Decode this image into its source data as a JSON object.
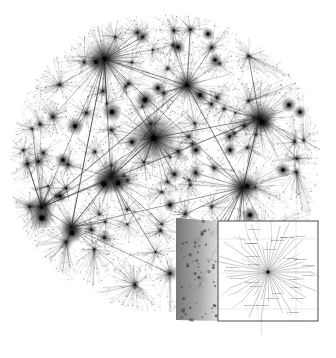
{
  "figure": {
    "caption": "",
    "background_color": "#ffffff",
    "ink_color": "#2b2b2b",
    "inset_border_color": "#4a4a4a",
    "cone_color_near": "#8a8a8a",
    "cone_color_far": "#d8d8d8"
  },
  "chart_data": {
    "type": "scatter",
    "subtitle": "",
    "xlabel": "",
    "ylabel": "",
    "grid": false,
    "legend_position": "none",
    "node_count_approx": 20000,
    "edge_count_approx": 55000,
    "layout": "force-directed radial",
    "hub_nodes": [
      {
        "x": 0.46,
        "y": 0.4,
        "degree": 980,
        "label": "core-hub"
      },
      {
        "x": 0.31,
        "y": 0.16,
        "degree": 640,
        "label": "hub-nw"
      },
      {
        "x": 0.78,
        "y": 0.34,
        "degree": 520,
        "label": "hub-ne"
      },
      {
        "x": 0.33,
        "y": 0.52,
        "degree": 470,
        "label": "hub-w"
      },
      {
        "x": 0.73,
        "y": 0.55,
        "degree": 430,
        "label": "hub-e"
      },
      {
        "x": 0.12,
        "y": 0.61,
        "degree": 300,
        "label": "hub-sw"
      },
      {
        "x": 0.56,
        "y": 0.24,
        "degree": 360,
        "label": "hub-n"
      },
      {
        "x": 0.21,
        "y": 0.67,
        "degree": 260,
        "label": "hub-s"
      }
    ],
    "series": [
      {
        "name": "links",
        "values": []
      }
    ]
  },
  "inset": {
    "name": "magnified-router-detail",
    "center_node": "12.123.45.1",
    "visible": true,
    "box": {
      "x": 218,
      "y": 221,
      "w": 100,
      "h": 100
    },
    "labels": [
      "12.123.1.1",
      "63.218.7.6",
      "207.45.223.1",
      "64.125.28.1",
      "4.68.127.1",
      "195.22.216.1",
      "208.173.50.1",
      "216.115.96.1",
      "129.250.3.1",
      "213.248.96.1",
      "62.40.96.1",
      "134.55.209.1",
      "80.81.192.1",
      "198.32.176.1",
      "144.232.2.1",
      "205.171.4.1",
      "38.104.84.1",
      "157.130.10.1",
      "209.244.2.1",
      "64.214.12.1",
      "66.185.128.1",
      "192.205.32.1",
      "12.122.10.1",
      "165.87.33.1"
    ],
    "bold_labels": [
      "12.123.45.1",
      "209.244.2.1",
      "144.232.2.1"
    ]
  },
  "cone": {
    "name": "magnification-cone",
    "apex": {
      "x": 176,
      "y": 218
    },
    "base_top": {
      "x": 218,
      "y": 221
    },
    "base_bottom": {
      "x": 218,
      "y": 321
    },
    "foot": {
      "x": 176,
      "y": 320
    }
  }
}
